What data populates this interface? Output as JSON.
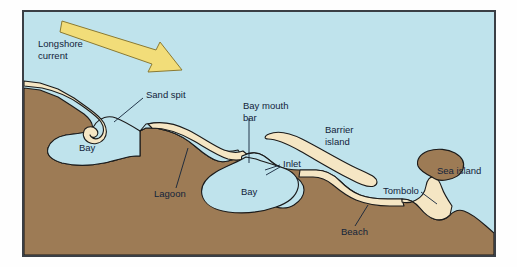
{
  "figure": {
    "frame": {
      "border_color": "#3a3f45",
      "margin_background": "#fefefe"
    }
  },
  "palette": {
    "water": "#bfe3ec",
    "land": "#9d7b55",
    "sand": "#f5e6c4",
    "arrow_fill": "#f2dd79",
    "arrow_stroke": "#8a7a33",
    "outline": "#1a1a1a",
    "text": "#13243a"
  },
  "labels": [
    {
      "id": "longshore-current",
      "text_lines": [
        "Longshore",
        "current"
      ],
      "x": 38,
      "y": 44
    },
    {
      "id": "sand-spit",
      "text_lines": [
        "Sand spit"
      ],
      "x": 146,
      "y": 95
    },
    {
      "id": "bay-left",
      "text_lines": [
        "Bay"
      ],
      "x": 79,
      "y": 148
    },
    {
      "id": "lagoon",
      "text_lines": [
        "Lagoon"
      ],
      "x": 154,
      "y": 194
    },
    {
      "id": "bay-mouth-bar",
      "text_lines": [
        "Bay mouth",
        "bar"
      ],
      "x": 243,
      "y": 106
    },
    {
      "id": "bay-center",
      "text_lines": [
        "Bay"
      ],
      "x": 241,
      "y": 192
    },
    {
      "id": "inlet",
      "text_lines": [
        "Inlet"
      ],
      "x": 283,
      "y": 164
    },
    {
      "id": "barrier-island",
      "text_lines": [
        "Barrier",
        "island"
      ],
      "x": 325,
      "y": 130
    },
    {
      "id": "sea-island",
      "text_lines": [
        "Sea island"
      ],
      "x": 437,
      "y": 171
    },
    {
      "id": "tombolo",
      "text_lines": [
        "Tombolo"
      ],
      "x": 383,
      "y": 191
    },
    {
      "id": "beach",
      "text_lines": [
        "Beach"
      ],
      "x": 341,
      "y": 232
    }
  ],
  "features": [
    {
      "id": "water-body",
      "name": "ocean-water",
      "type": "water"
    },
    {
      "id": "mainland",
      "name": "mainland-landmass",
      "type": "land"
    },
    {
      "id": "sand-spit-shape",
      "name": "sand-spit",
      "type": "sand"
    },
    {
      "id": "baymouth-bar-shape",
      "name": "bay-mouth-bar",
      "type": "sand"
    },
    {
      "id": "barrier-island-shape",
      "name": "barrier-island",
      "type": "sand"
    },
    {
      "id": "beach-shape",
      "name": "beach",
      "type": "sand"
    },
    {
      "id": "tombolo-shape",
      "name": "tombolo",
      "type": "sand"
    },
    {
      "id": "sea-island-shape",
      "name": "sea-island",
      "type": "land"
    },
    {
      "id": "lagoon-water",
      "name": "lagoon",
      "type": "water"
    },
    {
      "id": "bay-left-water",
      "name": "bay-left",
      "type": "water"
    },
    {
      "id": "bay-center-water",
      "name": "bay-center",
      "type": "water"
    },
    {
      "id": "longshore-arrow",
      "name": "longshore-current-arrow",
      "type": "arrow"
    }
  ]
}
